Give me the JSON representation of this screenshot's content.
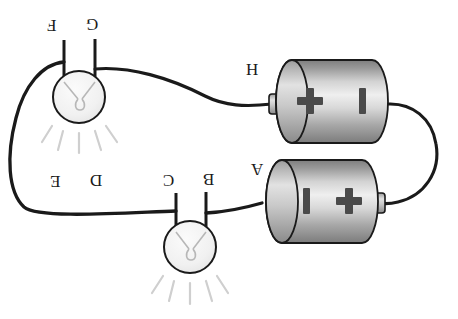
{
  "diagram": {
    "background_color": "#ffffff",
    "wire_color": "#1a1a1a",
    "labels_rotated_180": true,
    "labels": [
      {
        "name": "label-f",
        "text": "F",
        "x": 47,
        "y": 17
      },
      {
        "name": "label-g",
        "text": "G",
        "x": 86,
        "y": 16
      },
      {
        "name": "label-h",
        "text": "H",
        "x": 246,
        "y": 61
      },
      {
        "name": "label-a",
        "text": "A",
        "x": 251,
        "y": 161
      },
      {
        "name": "label-e",
        "text": "E",
        "x": 50,
        "y": 173
      },
      {
        "name": "label-d",
        "text": "D",
        "x": 90,
        "y": 172
      },
      {
        "name": "label-c",
        "text": "C",
        "x": 163,
        "y": 172
      },
      {
        "name": "label-b",
        "text": "B",
        "x": 203,
        "y": 171
      }
    ],
    "bulbs": [
      {
        "name": "bulb-top",
        "cx": 79,
        "cy": 97,
        "r": 26,
        "glass_fill": "#f4f4f4",
        "outline": "#1a1a1a",
        "ray_color": "#cccccc",
        "terminal_left_x": 64,
        "terminal_right_x": 94,
        "terminal_top_y": 41
      },
      {
        "name": "bulb-bottom",
        "cx": 190,
        "cy": 247,
        "r": 26,
        "glass_fill": "#f4f4f4",
        "outline": "#1a1a1a",
        "ray_color": "#cccccc",
        "terminal_left_x": 176,
        "terminal_right_x": 206,
        "terminal_top_y": 194
      }
    ],
    "batteries": [
      {
        "name": "battery-top",
        "label": "H",
        "x": 276,
        "y": 60,
        "width": 112,
        "height": 83,
        "left_symbol": "+",
        "right_symbol": "–",
        "nub_side": "left",
        "body_fill_light": "#e9e9e9",
        "body_fill_dark": "#8d8d8d",
        "outline": "#1a1a1a"
      },
      {
        "name": "battery-bottom",
        "label": "A",
        "x": 266,
        "y": 160,
        "width": 112,
        "height": 83,
        "left_symbol": "–",
        "right_symbol": "+",
        "nub_side": "right",
        "body_fill_light": "#e9e9e9",
        "body_fill_dark": "#8d8d8d",
        "outline": "#1a1a1a"
      }
    ],
    "wires": [
      {
        "name": "wire-bulb-top-to-battery-h",
        "from": "G",
        "to": "H"
      },
      {
        "name": "wire-bulb-top-left-to-left-loop",
        "from": "F",
        "to": "E"
      },
      {
        "name": "wire-left-loop-to-bulb-bottom",
        "from": "E",
        "to": "C"
      },
      {
        "name": "wire-bulb-bottom-to-battery-a",
        "from": "B",
        "to": "A"
      },
      {
        "name": "wire-right-loop-battery-h-to-battery-a",
        "from": "battery-top-minus",
        "to": "battery-bottom-plus"
      }
    ]
  }
}
